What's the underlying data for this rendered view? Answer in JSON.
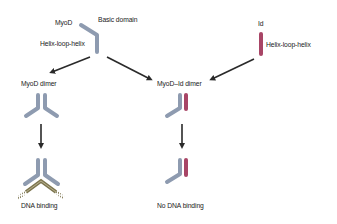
{
  "colors": {
    "myod": "#8e9bb0",
    "id": "#a84566",
    "dna": "#7d7650",
    "arrow": "#2a2a2a",
    "text": "#222222"
  },
  "labels": {
    "myod": "MyoD",
    "basic_domain": "Basic domain",
    "myod_hlh": "Helix-loop-helix",
    "id": "Id",
    "id_hlh": "Helix-loop-helix",
    "myod_dimer": "MyoD dimer",
    "myod_id_dimer": "MyoD–Id dimer",
    "dna_binding": "DNA binding",
    "no_dna_binding": "No DNA binding"
  },
  "nodes": [
    {
      "id": "myod-monomer",
      "type": "protein",
      "label": "MyoD"
    },
    {
      "id": "id-monomer",
      "type": "protein",
      "label": "Id"
    },
    {
      "id": "myod-dimer",
      "type": "complex",
      "label": "MyoD dimer"
    },
    {
      "id": "myod-id-dimer",
      "type": "complex",
      "label": "MyoD–Id dimer"
    },
    {
      "id": "dna-bound",
      "type": "outcome",
      "label": "DNA binding"
    },
    {
      "id": "no-dna",
      "type": "outcome",
      "label": "No DNA binding"
    }
  ],
  "edges": [
    {
      "from": "myod-monomer",
      "to": "myod-dimer"
    },
    {
      "from": "myod-monomer",
      "to": "myod-id-dimer"
    },
    {
      "from": "id-monomer",
      "to": "myod-id-dimer"
    },
    {
      "from": "myod-dimer",
      "to": "dna-bound"
    },
    {
      "from": "myod-id-dimer",
      "to": "no-dna"
    }
  ]
}
